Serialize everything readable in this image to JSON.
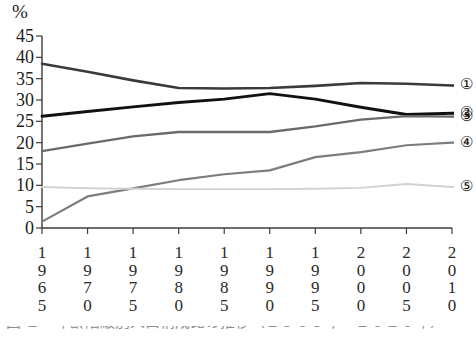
{
  "figure": {
    "unit_label": "%",
    "caption_partial": "図 １　年齢階級別人口構成比の推移（１９６５年～２０１０年）",
    "series_keys": [
      "①",
      "②",
      "③",
      "④",
      "⑤"
    ]
  },
  "chart_data": {
    "type": "line",
    "title": "",
    "xlabel": "",
    "ylabel": "%",
    "ylim": [
      0,
      45
    ],
    "ytick_labels": [
      "45",
      "40",
      "35",
      "30",
      "25",
      "20",
      "15",
      "10",
      "5",
      "0"
    ],
    "yticks": [
      45,
      40,
      35,
      30,
      25,
      20,
      15,
      10,
      5,
      0
    ],
    "grid": false,
    "legend_position": "right-of-plot",
    "x": [
      1965,
      1970,
      1975,
      1980,
      1985,
      1990,
      1995,
      2000,
      2005,
      2010
    ],
    "xtick_labels": [
      "1965",
      "1970",
      "1975",
      "1980",
      "1985",
      "1990",
      "1995",
      "2000",
      "2005",
      "2010"
    ],
    "series": [
      {
        "name": "①",
        "key": "1",
        "color": "#3a3a3a",
        "values": [
          38.5,
          36.6,
          34.6,
          32.8,
          32.7,
          32.8,
          33.3,
          34.0,
          33.8,
          33.4
        ]
      },
      {
        "name": "②",
        "key": "2",
        "color": "#111111",
        "values": [
          26.2,
          27.3,
          28.4,
          29.4,
          30.2,
          31.5,
          30.2,
          28.3,
          26.6,
          26.9
        ]
      },
      {
        "name": "③",
        "key": "3",
        "color": "#6a6a6a",
        "values": [
          18.0,
          19.8,
          21.5,
          22.5,
          22.5,
          22.5,
          23.8,
          25.4,
          26.2,
          26.1
        ]
      },
      {
        "name": "④",
        "key": "4",
        "color": "#7d7d7d",
        "values": [
          1.5,
          7.4,
          9.3,
          11.2,
          12.6,
          13.5,
          16.6,
          17.8,
          19.4,
          20.0
        ]
      },
      {
        "name": "⑤",
        "key": "5",
        "color": "#d2d2d2",
        "values": [
          9.6,
          9.3,
          9.2,
          9.1,
          9.1,
          9.1,
          9.2,
          9.4,
          10.3,
          9.6
        ]
      }
    ]
  }
}
